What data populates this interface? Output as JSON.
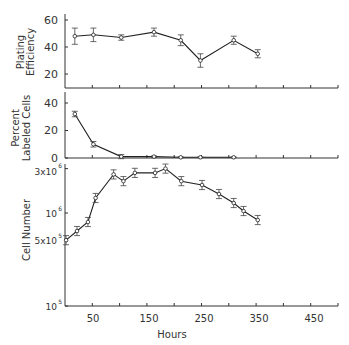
{
  "chart_data": [
    {
      "type": "line",
      "panel": "top",
      "ylabel": "Plating Efficiency",
      "xlabel": "",
      "ylim": [
        10,
        62
      ],
      "yticks": [
        20,
        40,
        60
      ],
      "xlim": [
        0,
        500
      ],
      "x": [
        18,
        52,
        103,
        163,
        212,
        248,
        309,
        353
      ],
      "values": [
        48,
        49,
        47,
        51,
        45,
        30,
        45,
        35
      ],
      "errors": [
        6,
        5,
        2,
        3,
        4,
        5,
        3,
        3
      ],
      "grid": false
    },
    {
      "type": "line",
      "panel": "middle",
      "ylabel": "Percent Labeled Cells",
      "xlabel": "",
      "ylim": [
        0,
        47
      ],
      "yticks": [
        0,
        20,
        40
      ],
      "xlim": [
        0,
        500
      ],
      "x": [
        18,
        52,
        103,
        163,
        212,
        248,
        309
      ],
      "values": [
        32,
        10,
        1,
        1,
        0.5,
        0.5,
        0.5
      ],
      "errors": [
        2,
        2,
        1.5,
        0.5,
        0.3,
        0.3,
        0.3
      ],
      "grid": false
    },
    {
      "type": "line",
      "panel": "bottom",
      "ylabel": "Cell Number",
      "xlabel": "Hours",
      "yscale": "log",
      "ylim": [
        100000,
        3500000
      ],
      "yticks": [
        100000,
        500000,
        1000000,
        3000000
      ],
      "ytick_labels": [
        "10^5",
        "5x10^5",
        "10^6",
        "3x10^6"
      ],
      "xlim": [
        0,
        500
      ],
      "xticks": [
        50,
        150,
        250,
        350,
        450
      ],
      "x": [
        2,
        22,
        42,
        56,
        89,
        107,
        128,
        165,
        184,
        213,
        251,
        282,
        309,
        327,
        353
      ],
      "values": [
        510000,
        640000,
        800000,
        1450000,
        2600000,
        2200000,
        2700000,
        2700000,
        3000000,
        2200000,
        2000000,
        1600000,
        1280000,
        1050000,
        840000
      ],
      "grid": false
    }
  ],
  "labels": {
    "top_ylabel_line1": "Plating",
    "top_ylabel_line2": "Efficiency",
    "mid_ylabel_line1": "Percent",
    "mid_ylabel_line2": "Labeled Cells",
    "bot_ylabel": "Cell Number",
    "xlabel": "Hours",
    "top_ticks": [
      "60",
      "40",
      "20"
    ],
    "mid_ticks": [
      "40",
      "20",
      "0"
    ],
    "bot_ticks": [
      "3x10",
      "10",
      "5x10",
      "10"
    ],
    "bot_tick_exps": [
      "6",
      "6",
      "5",
      "5"
    ],
    "x_ticks": [
      "50",
      "150",
      "250",
      "350",
      "450"
    ]
  }
}
